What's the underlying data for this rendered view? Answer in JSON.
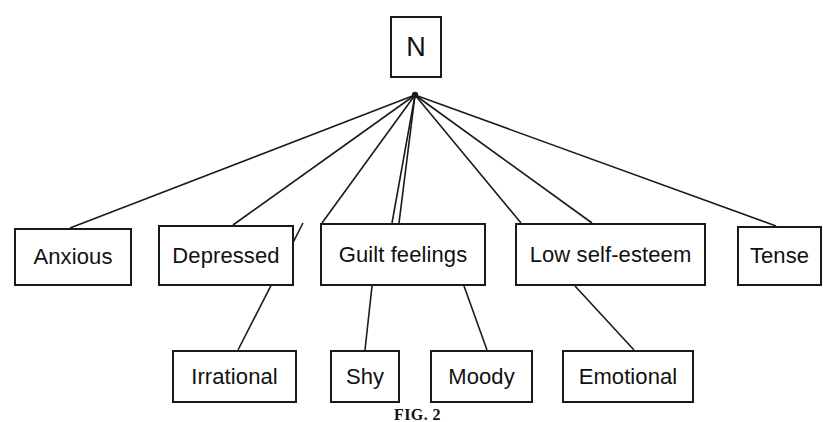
{
  "figure": {
    "caption": "FIG. 2",
    "caption_top": 406,
    "background_color": "#ffffff",
    "line_color": "#1a1a1a",
    "text_color": "#111111",
    "width": 835,
    "height": 422
  },
  "apex": {
    "x": 415,
    "y": 95
  },
  "nodes": {
    "root": {
      "label": "N",
      "x": 390,
      "y": 16,
      "w": 52,
      "h": 62
    },
    "level1": [
      {
        "key": "anxious",
        "label": "Anxious",
        "x": 14,
        "y": 228,
        "w": 118,
        "h": 58
      },
      {
        "key": "depressed",
        "label": "Depressed",
        "x": 158,
        "y": 225,
        "w": 136,
        "h": 61
      },
      {
        "key": "guilt_feelings",
        "label": "Guilt feelings",
        "x": 320,
        "y": 223,
        "w": 166,
        "h": 63
      },
      {
        "key": "low_self_esteem",
        "label": "Low self-esteem",
        "x": 515,
        "y": 223,
        "w": 191,
        "h": 63
      },
      {
        "key": "tense",
        "label": "Tense",
        "x": 737,
        "y": 226,
        "w": 85,
        "h": 60
      }
    ],
    "level2": [
      {
        "key": "irrational",
        "label": "Irrational",
        "x": 172,
        "y": 350,
        "w": 125,
        "h": 53
      },
      {
        "key": "shy",
        "label": "Shy",
        "x": 330,
        "y": 350,
        "w": 70,
        "h": 53
      },
      {
        "key": "moody",
        "label": "Moody",
        "x": 430,
        "y": 350,
        "w": 103,
        "h": 53
      },
      {
        "key": "emotional",
        "label": "Emotional",
        "x": 562,
        "y": 350,
        "w": 132,
        "h": 53
      }
    ]
  },
  "edges": [
    {
      "from": "root",
      "to": "anxious",
      "x1": 415,
      "y1": 95,
      "x2": 70,
      "y2": 228
    },
    {
      "from": "root",
      "to": "depressed",
      "x1": 415,
      "y1": 95,
      "x2": 233,
      "y2": 225
    },
    {
      "from": "root",
      "to": "guilt_feelings",
      "x1": 415,
      "y1": 95,
      "x2": 399,
      "y2": 223
    },
    {
      "from": "root",
      "to": "guilt_feelings2",
      "x1": 415,
      "y1": 95,
      "x2": 392,
      "y2": 223
    },
    {
      "from": "root",
      "to": "irrational_path",
      "x1": 415,
      "y1": 95,
      "x2": 322,
      "y2": 223
    },
    {
      "from": "root",
      "to": "low_self_esteem",
      "x1": 415,
      "y1": 95,
      "x2": 521,
      "y2": 223
    },
    {
      "from": "root",
      "to": "low_self_esteem2",
      "x1": 415,
      "y1": 95,
      "x2": 592,
      "y2": 223
    },
    {
      "from": "root",
      "to": "tense",
      "x1": 415,
      "y1": 95,
      "x2": 776,
      "y2": 226
    },
    {
      "from": "guilt_feelings",
      "to": "shy",
      "x1": 372,
      "y1": 286,
      "x2": 365,
      "y2": 350
    },
    {
      "from": "guilt_feelings",
      "to": "moody",
      "x1": 464,
      "y1": 286,
      "x2": 487,
      "y2": 350
    },
    {
      "from": "low_self_esteem",
      "to": "emotional",
      "x1": 575,
      "y1": 286,
      "x2": 634,
      "y2": 350
    },
    {
      "from": "depressed_cross",
      "to": "irrational",
      "x1": 303,
      "y1": 223,
      "x2": 238,
      "y2": 350
    }
  ]
}
